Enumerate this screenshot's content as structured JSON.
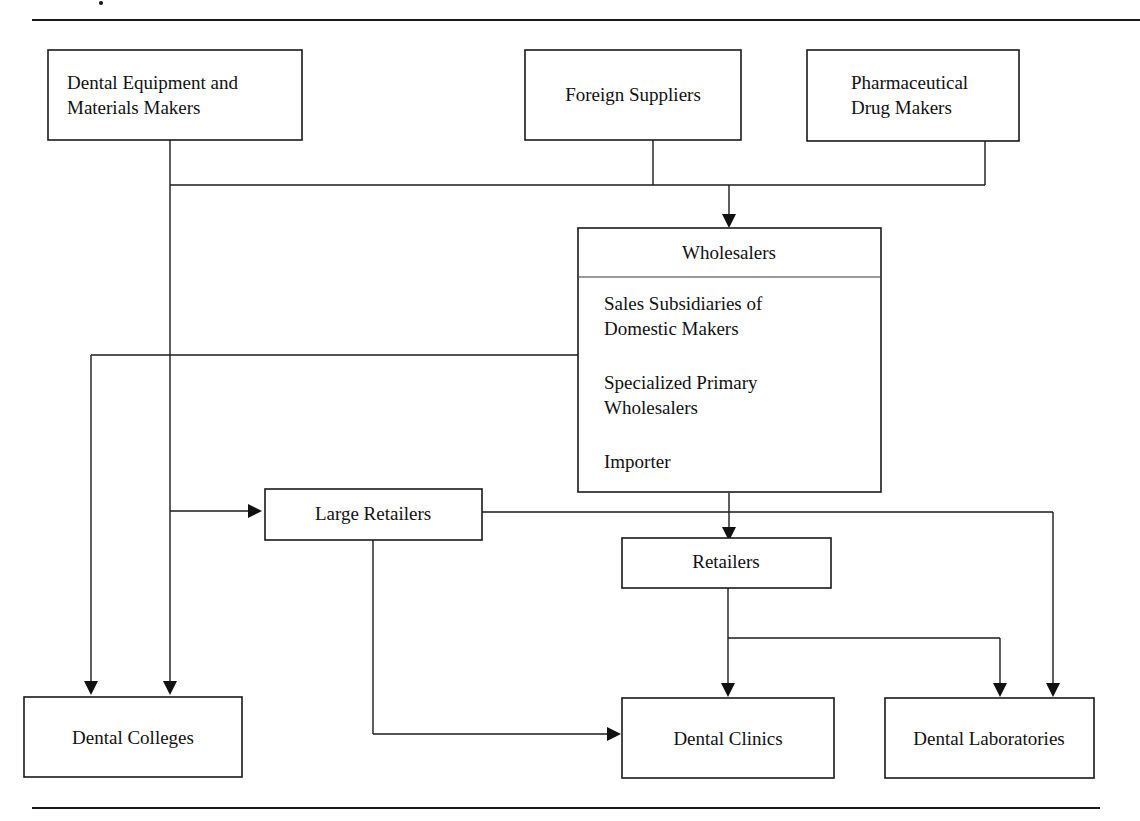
{
  "diagram": {
    "nodes": {
      "equipment_makers": {
        "lines": [
          "Dental Equipment and",
          "Materials Makers"
        ]
      },
      "foreign_suppliers": {
        "lines": [
          "Foreign Suppliers"
        ]
      },
      "pharma_makers": {
        "lines": [
          "Pharmaceutical",
          "Drug Makers"
        ]
      },
      "wholesalers": {
        "header": "Wholesalers",
        "items": [
          [
            "Sales Subsidiaries of",
            "Domestic Makers"
          ],
          [
            "Specialized Primary",
            "Wholesalers"
          ],
          [
            "Importer"
          ]
        ]
      },
      "large_retailers": {
        "lines": [
          "Large Retailers"
        ]
      },
      "retailers": {
        "lines": [
          "Retailers"
        ]
      },
      "dental_colleges": {
        "lines": [
          "Dental Colleges"
        ]
      },
      "dental_clinics": {
        "lines": [
          "Dental Clinics"
        ]
      },
      "dental_laboratories": {
        "lines": [
          "Dental Laboratories"
        ]
      }
    },
    "edges": [
      {
        "from": "equipment_makers",
        "to": "wholesalers"
      },
      {
        "from": "foreign_suppliers",
        "to": "wholesalers"
      },
      {
        "from": "pharma_makers",
        "to": "wholesalers"
      },
      {
        "from": "equipment_makers",
        "to": "large_retailers"
      },
      {
        "from": "equipment_makers",
        "to": "dental_colleges"
      },
      {
        "from": "wholesalers",
        "to": "dental_colleges"
      },
      {
        "from": "wholesalers",
        "to": "retailers"
      },
      {
        "from": "large_retailers",
        "to": "dental_clinics"
      },
      {
        "from": "large_retailers",
        "to": "dental_laboratories"
      },
      {
        "from": "retailers",
        "to": "dental_clinics"
      },
      {
        "from": "retailers",
        "to": "dental_laboratories"
      }
    ],
    "colors": {
      "stroke": "#1a1a1a",
      "background": "#ffffff",
      "divider": "#777777"
    }
  }
}
